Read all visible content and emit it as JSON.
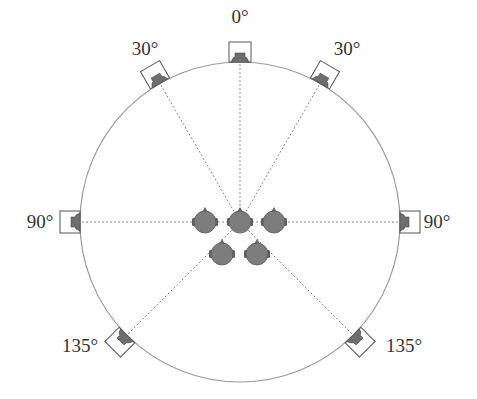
{
  "diagram": {
    "circle": {
      "cx": 240,
      "cy": 222,
      "r": 160,
      "stroke": "#9a9a9a"
    },
    "colors": {
      "speaker_fill": "#6e6e6e",
      "head_fill": "#7d7d7d",
      "line": "#8a8a8a",
      "text": "#333333"
    },
    "speakers": [
      {
        "id": "front-center",
        "angle": 0,
        "label": "0°",
        "lx": 240,
        "ly": 23
      },
      {
        "id": "front-left",
        "angle": -30,
        "label": "30°",
        "lx": 145,
        "ly": 55
      },
      {
        "id": "front-right",
        "angle": 30,
        "label": "30°",
        "lx": 347,
        "ly": 55
      },
      {
        "id": "side-left",
        "angle": -90,
        "label": "90°",
        "lx": 40,
        "ly": 228
      },
      {
        "id": "side-right",
        "angle": 90,
        "label": "90°",
        "lx": 437,
        "ly": 228
      },
      {
        "id": "rear-left",
        "angle": -135,
        "label": "135°",
        "lx": 80,
        "ly": 352
      },
      {
        "id": "rear-right",
        "angle": 135,
        "label": "135°",
        "lx": 404,
        "ly": 352
      }
    ],
    "listeners": [
      {
        "id": "listener-left",
        "x": 205,
        "y": 222
      },
      {
        "id": "listener-center",
        "x": 240,
        "y": 222
      },
      {
        "id": "listener-right",
        "x": 274,
        "y": 222
      },
      {
        "id": "listener-rear-left",
        "x": 222,
        "y": 254
      },
      {
        "id": "listener-rear-right",
        "x": 257,
        "y": 254
      }
    ]
  }
}
